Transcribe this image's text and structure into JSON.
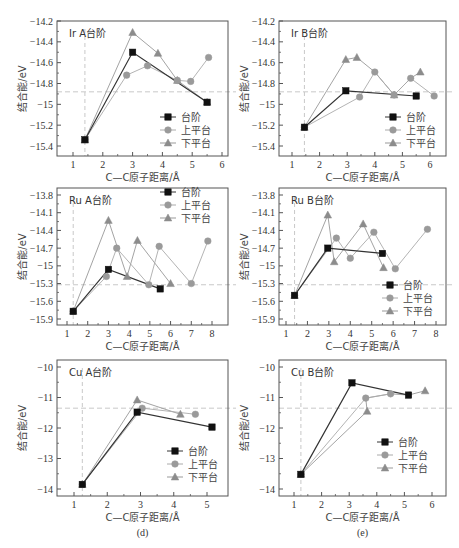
{
  "legend": [
    "台阶",
    "上平台",
    "下平台"
  ],
  "series_colors": {
    "台阶": "#111111",
    "上平台": "#9a9a9a",
    "下平台": "#8c8c8c"
  },
  "line_colors": {
    "台阶": "#333333",
    "上平台": "#aaaaaa",
    "下平台": "#999999"
  },
  "reference_line_color": "#c8c8c8",
  "xlabel": "C—C原子距离/Å",
  "ylabel": "结合能/eV",
  "chart_data": [
    {
      "type": "line",
      "title": "Ir A台阶",
      "xlabel": "C—C原子距离/Å",
      "ylabel": "结合能/eV",
      "xlim": [
        0.4,
        6
      ],
      "ylim": [
        -15.5,
        -14.2
      ],
      "xticks": [
        1,
        2,
        3,
        4,
        5,
        6
      ],
      "yticks": [
        -14.2,
        -14.4,
        -14.6,
        -14.8,
        -15.0,
        -15.2,
        -15.4
      ],
      "ref_x": 1.4,
      "ref_y": -14.88,
      "legend_pos": "lower-right",
      "frame": {
        "x0": 57,
        "y0": 21,
        "x1": 228,
        "y1": 156,
        "px_x1": 73,
        "px_x2": 222,
        "vx1": 1,
        "vx2": 6,
        "py1": 21,
        "py2": 146,
        "vy1": -14.2,
        "vy2": -15.4
      },
      "legend_box": {
        "x": 160,
        "y": 117
      },
      "series": [
        {
          "name": "台阶",
          "marker": "square",
          "x": [
            1.4,
            3.0,
            5.5
          ],
          "y": [
            -15.34,
            -14.5,
            -14.98
          ]
        },
        {
          "name": "上平台",
          "marker": "circle",
          "x": [
            1.4,
            2.8,
            3.5,
            4.5,
            4.95,
            5.55
          ],
          "y": [
            -15.34,
            -14.72,
            -14.63,
            -14.77,
            -14.78,
            -14.55
          ]
        },
        {
          "name": "下平台",
          "marker": "triangle",
          "x": [
            1.4,
            3.0,
            3.85,
            4.5,
            5.5
          ],
          "y": [
            -15.34,
            -14.31,
            -14.51,
            -14.77,
            -14.98
          ]
        }
      ]
    },
    {
      "type": "line",
      "title": "Ir B台阶",
      "xlabel": "C—C原子距离/Å",
      "ylabel": "结合能/eV",
      "xlim": [
        0.5,
        6.5
      ],
      "ylim": [
        -15.5,
        -14.2
      ],
      "xticks": [
        1,
        2,
        3,
        4,
        5,
        6
      ],
      "yticks": [
        -14.2,
        -14.4,
        -14.6,
        -14.8,
        -15.0,
        -15.2,
        -15.4
      ],
      "ref_x": 1.45,
      "ref_y": -14.88,
      "legend_pos": "lower-right",
      "frame": {
        "x0": 279,
        "y0": 21,
        "x1": 446,
        "y1": 156,
        "px_x1": 292,
        "px_x2": 430,
        "vx1": 1,
        "vx2": 6,
        "py1": 21,
        "py2": 146,
        "vy1": -14.2,
        "vy2": -15.4
      },
      "legend_box": {
        "x": 385,
        "y": 117
      },
      "series": [
        {
          "name": "台阶",
          "marker": "square",
          "x": [
            1.45,
            2.95,
            5.5
          ],
          "y": [
            -15.22,
            -14.87,
            -14.92
          ]
        },
        {
          "name": "上平台",
          "marker": "circle",
          "x": [
            1.45,
            3.45,
            4.0,
            4.7,
            5.3,
            6.15
          ],
          "y": [
            -15.22,
            -14.93,
            -14.69,
            -14.91,
            -14.75,
            -14.92
          ]
        },
        {
          "name": "下平台",
          "marker": "triangle",
          "x": [
            1.45,
            2.95,
            3.35,
            4.0,
            4.7,
            5.3,
            5.65
          ],
          "y": [
            -15.22,
            -14.57,
            -14.55,
            -14.69,
            -14.91,
            -14.75,
            -14.69
          ],
          "marker_idx": [
            0,
            1,
            2,
            4,
            6
          ]
        }
      ]
    },
    {
      "type": "line",
      "title": "Ru A台阶",
      "xlabel": "C—C原子距离/Å",
      "ylabel": "结合能/eV",
      "xlim": [
        0.6,
        8.5
      ],
      "ylim": [
        -16.0,
        -13.7
      ],
      "xticks": [
        1,
        2,
        3,
        4,
        5,
        6,
        7,
        8
      ],
      "yticks": [
        -13.8,
        -14.1,
        -14.4,
        -14.7,
        -15.0,
        -15.3,
        -15.6,
        -15.9
      ],
      "ref_x": 1.3,
      "ref_y": -15.32,
      "legend_pos": "upper-right",
      "frame": {
        "x0": 57,
        "y0": 188,
        "x1": 228,
        "y1": 325,
        "px_x1": 67,
        "px_x2": 212,
        "vx1": 1,
        "vx2": 8,
        "py1": 195,
        "py2": 319,
        "vy1": -13.8,
        "vy2": -15.9
      },
      "legend_box": {
        "x": 160,
        "y": 192
      },
      "series": [
        {
          "name": "台阶",
          "marker": "square",
          "x": [
            1.3,
            3.0,
            5.5
          ],
          "y": [
            -15.77,
            -15.06,
            -15.39
          ]
        },
        {
          "name": "上平台",
          "marker": "circle",
          "x": [
            1.3,
            2.9,
            3.4,
            4.95,
            5.45,
            7.0,
            7.8
          ],
          "y": [
            -15.77,
            -15.18,
            -14.7,
            -15.32,
            -14.67,
            -15.3,
            -14.58
          ]
        },
        {
          "name": "下平台",
          "marker": "triangle",
          "x": [
            1.3,
            3.0,
            3.9,
            4.4,
            6.0
          ],
          "y": [
            -15.77,
            -14.23,
            -15.18,
            -14.57,
            -15.3
          ]
        }
      ]
    },
    {
      "type": "line",
      "title": "Ru B台阶",
      "xlabel": "C—C原子距离/Å",
      "ylabel": "结合能/eV",
      "xlim": [
        0.6,
        8.5
      ],
      "ylim": [
        -16.0,
        -13.7
      ],
      "xticks": [
        1,
        2,
        3,
        4,
        5,
        6,
        7,
        8
      ],
      "yticks": [
        -13.8,
        -14.1,
        -14.4,
        -14.7,
        -15.0,
        -15.3,
        -15.6,
        -15.9
      ],
      "ref_x": 1.4,
      "ref_y": -15.32,
      "legend_pos": "lower-right",
      "frame": {
        "x0": 279,
        "y0": 188,
        "x1": 446,
        "y1": 325,
        "px_x1": 286,
        "px_x2": 436,
        "vx1": 1,
        "vx2": 8,
        "py1": 195,
        "py2": 319,
        "vy1": -13.8,
        "vy2": -15.9
      },
      "legend_box": {
        "x": 382,
        "y": 285
      },
      "series": [
        {
          "name": "台阶",
          "marker": "square",
          "x": [
            1.4,
            2.95,
            5.5
          ],
          "y": [
            -15.5,
            -14.7,
            -14.79
          ]
        },
        {
          "name": "上平台",
          "marker": "circle",
          "x": [
            1.4,
            3.35,
            4.0,
            5.1,
            6.1,
            7.6
          ],
          "y": [
            -15.5,
            -14.53,
            -14.87,
            -14.43,
            -15.05,
            -14.38
          ]
        },
        {
          "name": "下平台",
          "marker": "triangle",
          "x": [
            1.4,
            2.95,
            3.25,
            4.6,
            5.55
          ],
          "y": [
            -15.5,
            -14.14,
            -14.93,
            -14.29,
            -15.03
          ]
        }
      ]
    },
    {
      "type": "line",
      "title": "Cu A台阶",
      "xlabel": "C—C原子距离/Å",
      "ylabel": "结合能/eV",
      "sublabel": "(d)",
      "xlim": [
        0.5,
        5.3
      ],
      "ylim": [
        -14.2,
        -9.9
      ],
      "xticks": [
        1,
        2,
        3,
        4,
        5
      ],
      "yticks": [
        -10,
        -11,
        -12,
        -13,
        -14
      ],
      "ref_x": 1.25,
      "ref_y": -11.35,
      "legend_pos": "lower-right",
      "frame": {
        "x0": 57,
        "y0": 360,
        "x1": 228,
        "y1": 496,
        "px_x1": 74,
        "px_x2": 207,
        "vx1": 1,
        "vx2": 5,
        "py1": 367,
        "py2": 489,
        "vy1": -10,
        "vy2": -14
      },
      "legend_box": {
        "x": 167,
        "y": 451
      },
      "series": [
        {
          "name": "台阶",
          "marker": "square",
          "x": [
            1.25,
            2.9,
            5.15
          ],
          "y": [
            -13.85,
            -11.48,
            -11.97
          ]
        },
        {
          "name": "上平台",
          "marker": "circle",
          "x": [
            1.25,
            3.05,
            4.65
          ],
          "y": [
            -13.85,
            -11.35,
            -11.55
          ]
        },
        {
          "name": "下平台",
          "marker": "triangle",
          "x": [
            1.25,
            2.9,
            4.2
          ],
          "y": [
            -13.85,
            -11.08,
            -11.55
          ]
        }
      ]
    },
    {
      "type": "line",
      "title": "Cu B台阶",
      "xlabel": "C—C原子距离/Å",
      "ylabel": "结合能/eV",
      "sublabel": "(e)",
      "xlim": [
        0.6,
        6.4
      ],
      "ylim": [
        -14.2,
        -9.9
      ],
      "xticks": [
        1,
        2,
        3,
        4,
        5,
        6
      ],
      "yticks": [
        -10,
        -11,
        -12,
        -13,
        -14
      ],
      "ref_x": 1.25,
      "ref_y": -11.35,
      "legend_pos": "center-right",
      "frame": {
        "x0": 279,
        "y0": 360,
        "x1": 446,
        "y1": 496,
        "px_x1": 294,
        "px_x2": 432,
        "vx1": 1,
        "vx2": 6,
        "py1": 367,
        "py2": 489,
        "vy1": -10,
        "vy2": -14
      },
      "legend_box": {
        "x": 377,
        "y": 442
      },
      "series": [
        {
          "name": "台阶",
          "marker": "square",
          "x": [
            1.25,
            3.1,
            5.15
          ],
          "y": [
            -13.52,
            -10.52,
            -10.92
          ]
        },
        {
          "name": "上平台",
          "marker": "circle",
          "x": [
            1.25,
            3.6,
            4.5
          ],
          "y": [
            -13.52,
            -11.02,
            -10.88
          ]
        },
        {
          "name": "下平台",
          "marker": "triangle",
          "x": [
            1.25,
            3.65,
            3.6,
            4.5,
            5.15,
            5.75
          ],
          "y": [
            -13.52,
            -11.45,
            -11.02,
            -10.88,
            -10.92,
            -10.78
          ],
          "marker_idx": [
            0,
            1,
            5
          ]
        }
      ]
    }
  ]
}
